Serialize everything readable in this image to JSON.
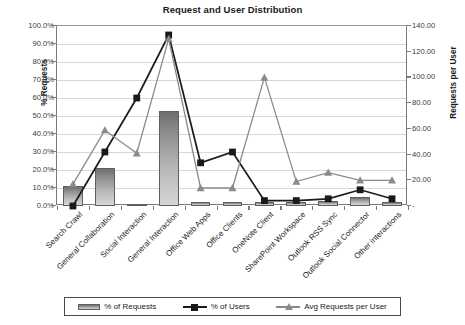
{
  "chart_data": {
    "type": "bar",
    "title": "Request and User Distribution",
    "xlabel": "",
    "ylabel": "% Requests",
    "y2label": "Requests per User",
    "ylim": [
      0,
      100
    ],
    "y2lim": [
      0,
      140
    ],
    "grid": true,
    "legend_position": "bottom",
    "categories": [
      "Search Crawl",
      "General Collaboration",
      "Social Interaction",
      "General Interaction",
      "Office Web Apps",
      "Office Clients",
      "OneNote Client",
      "SharePoint Workspace",
      "Outlook RSS Sync",
      "Outlook Social Connector",
      "Other interactions"
    ],
    "ytick_labels": [
      "100.0%",
      "90.0%",
      "80.0%",
      "70.0%",
      "60.0%",
      "50.0%",
      "40.0%",
      "30.0%",
      "20.0%",
      "10.0%",
      "0.0%"
    ],
    "ytick_values": [
      100,
      90,
      80,
      70,
      60,
      50,
      40,
      30,
      20,
      10,
      0
    ],
    "y2tick_labels": [
      "140.00",
      "120.00",
      "100.00",
      "80.00",
      "60.00",
      "40.00",
      "20.00",
      "-"
    ],
    "y2tick_values": [
      140,
      120,
      100,
      80,
      60,
      40,
      20,
      0
    ],
    "series": [
      {
        "name": "% of Requests",
        "axis": "left",
        "kind": "bar",
        "color": "#949494",
        "values": [
          11,
          21,
          1,
          53,
          2,
          2,
          2,
          2,
          3,
          5,
          2
        ]
      },
      {
        "name": "% of Users",
        "axis": "left",
        "kind": "line",
        "marker": "square",
        "color": "#1a1a1a",
        "values": [
          0,
          30,
          60,
          95,
          24,
          30,
          3,
          3,
          4,
          9,
          4
        ]
      },
      {
        "name": "Avg Requests per User",
        "axis": "right",
        "kind": "line",
        "marker": "triangle",
        "color": "#8a8a8a",
        "values": [
          17,
          59,
          41,
          130,
          14,
          14,
          100,
          19,
          26,
          20,
          20
        ]
      }
    ]
  },
  "legend": {
    "items": [
      {
        "label": "% of Requests"
      },
      {
        "label": "% of Users"
      },
      {
        "label": "Avg Requests per User"
      }
    ]
  }
}
